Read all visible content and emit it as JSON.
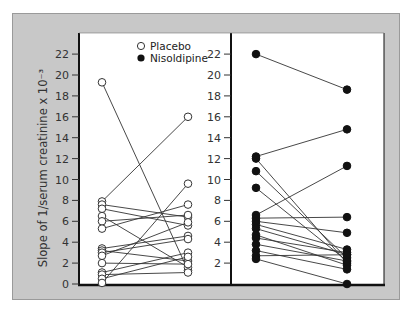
{
  "chart_data": {
    "type": "line",
    "title": "",
    "ylabel": "Slope of 1/serum creatinine x 10⁻³",
    "xlabel": "",
    "ylim": [
      0,
      23
    ],
    "yticks": [
      0,
      2,
      4,
      6,
      8,
      10,
      12,
      14,
      16,
      18,
      20,
      22
    ],
    "grid": false,
    "legend": {
      "position": "top-center",
      "entries": [
        {
          "label": "Placebo",
          "marker": "open-circle"
        },
        {
          "label": "Nisoldipine",
          "marker": "filled-circle"
        }
      ]
    },
    "panels": [
      {
        "name": "Placebo",
        "marker": "open-circle",
        "pairs": [
          [
            19.3,
            1.3
          ],
          [
            7.9,
            16.0
          ],
          [
            7.6,
            6.4
          ],
          [
            7.2,
            5.6
          ],
          [
            6.5,
            1.6
          ],
          [
            6.0,
            6.6
          ],
          [
            5.3,
            7.6
          ],
          [
            3.4,
            4.6
          ],
          [
            3.2,
            2.2
          ],
          [
            3.0,
            4.3
          ],
          [
            2.7,
            5.9
          ],
          [
            2.0,
            1.9
          ],
          [
            1.1,
            3.0
          ],
          [
            0.9,
            1.1
          ],
          [
            0.5,
            2.6
          ],
          [
            0.1,
            9.6
          ]
        ]
      },
      {
        "name": "Nisoldipine",
        "marker": "filled-circle",
        "pairs": [
          [
            22.0,
            18.6
          ],
          [
            12.2,
            14.8
          ],
          [
            12.0,
            2.0
          ],
          [
            10.8,
            2.5
          ],
          [
            9.2,
            2.2
          ],
          [
            6.6,
            11.3
          ],
          [
            6.3,
            6.4
          ],
          [
            6.0,
            4.9
          ],
          [
            5.7,
            3.3
          ],
          [
            5.3,
            2.8
          ],
          [
            4.7,
            1.8
          ],
          [
            4.4,
            3.0
          ],
          [
            3.8,
            2.2
          ],
          [
            3.2,
            1.4
          ],
          [
            2.7,
            2.8
          ],
          [
            2.4,
            0.0
          ]
        ]
      }
    ]
  }
}
